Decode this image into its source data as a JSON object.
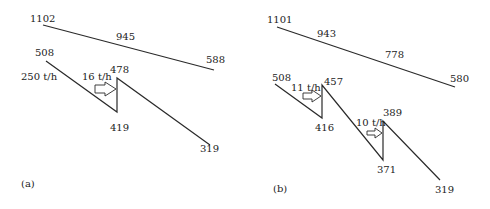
{
  "panels": [
    {
      "id": "a",
      "caption": "(a)",
      "hot_line": {
        "start": "1102",
        "mid": "945",
        "end": "588"
      },
      "cold_line": {
        "start": "508",
        "flow": "250 t/h",
        "injection_flow": "16 t/h",
        "before_injection": "419",
        "after_injection": "478",
        "end": "319"
      }
    },
    {
      "id": "b",
      "caption": "(b)",
      "hot_line": {
        "start": "1101",
        "mid1": "943",
        "mid2": "778",
        "end": "580"
      },
      "cold_line": {
        "start": "508",
        "injection1_flow": "11 t/h",
        "before_injection1": "416",
        "after_injection1": "457",
        "injection2_flow": "10 t/h",
        "before_injection2": "371",
        "after_injection2": "389",
        "end": "319"
      }
    }
  ],
  "colors": {
    "line": "#2a2a2a",
    "text": "#222222",
    "background": "#ffffff"
  }
}
